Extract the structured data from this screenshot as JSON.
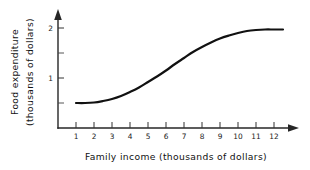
{
  "chart_data": {
    "type": "line",
    "title": "",
    "xlabel": "Family income (thousands of dollars)",
    "ylabel": "Food expenditure (thousands of dollars)",
    "ylabel_line1": "Food expenditure",
    "ylabel_line2": "(thousands of dollars)",
    "xlim": [
      0.4,
      13.2
    ],
    "ylim": [
      0,
      2.35
    ],
    "xticks": [
      1,
      2,
      3,
      4,
      5,
      6,
      7,
      8,
      9,
      10,
      11,
      12
    ],
    "xtick_labels": [
      "1",
      "2",
      "3",
      "4",
      "5",
      "6",
      "7",
      "8",
      "9",
      "10",
      "11",
      "12"
    ],
    "yticks": [
      0.5,
      1,
      1.5,
      2
    ],
    "ytick_labels": [
      "",
      "1",
      "",
      "2"
    ],
    "ytick_labeled": [
      1,
      2
    ],
    "grid": false,
    "legend": null,
    "curve_color": "#111111",
    "axis_color": "#262626",
    "background": "#ffffff",
    "x": [
      1.0,
      1.5,
      2.0,
      2.5,
      3.0,
      3.5,
      4.0,
      4.5,
      5.0,
      5.5,
      6.0,
      6.5,
      7.0,
      7.5,
      8.0,
      8.5,
      9.0,
      9.5,
      10.0,
      10.5,
      11.0,
      11.5,
      12.0,
      12.5
    ],
    "values": [
      0.5,
      0.5,
      0.51,
      0.54,
      0.58,
      0.64,
      0.72,
      0.81,
      0.92,
      1.03,
      1.15,
      1.28,
      1.4,
      1.52,
      1.62,
      1.71,
      1.79,
      1.85,
      1.9,
      1.94,
      1.96,
      1.97,
      1.97,
      1.97
    ],
    "annotations": []
  },
  "axes": {
    "x_arrow": "right-arrow-icon",
    "y_arrow": "up-arrow-icon"
  }
}
